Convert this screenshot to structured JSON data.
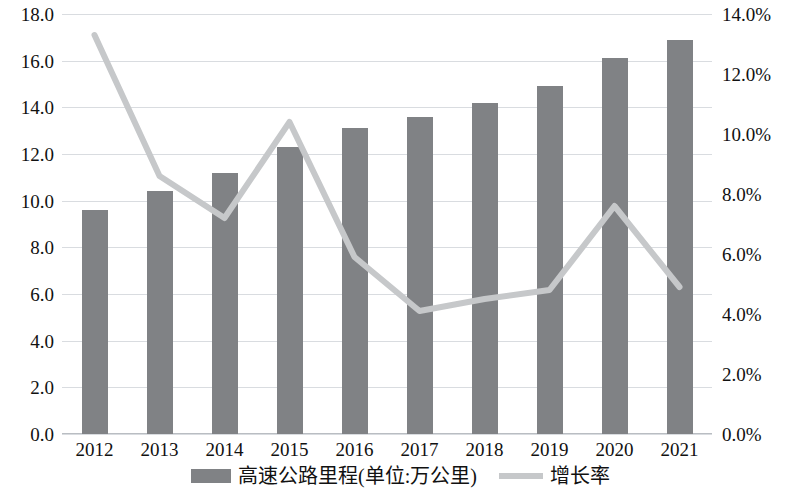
{
  "chart_data": {
    "type": "bar",
    "title": "",
    "subtitle": "",
    "xlabel": "",
    "ylabel": "",
    "grid": true,
    "legend_position": "bottom",
    "categories": [
      "2012",
      "2013",
      "2014",
      "2015",
      "2016",
      "2017",
      "2018",
      "2019",
      "2020",
      "2021"
    ],
    "axes": {
      "left": {
        "label": "高速公路里程(单位:万公里)",
        "min": 0.0,
        "max": 18.0,
        "step": 2.0,
        "ticks": [
          "0.0",
          "2.0",
          "4.0",
          "6.0",
          "8.0",
          "10.0",
          "12.0",
          "14.0",
          "16.0",
          "18.0"
        ],
        "tick_values": [
          0.0,
          2.0,
          4.0,
          6.0,
          8.0,
          10.0,
          12.0,
          14.0,
          16.0,
          18.0
        ]
      },
      "right": {
        "label": "增长率",
        "min": 0.0,
        "max": 14.0,
        "step": 2.0,
        "ticks": [
          "0.0%",
          "2.0%",
          "4.0%",
          "6.0%",
          "8.0%",
          "10.0%",
          "12.0%",
          "14.0%"
        ],
        "tick_values": [
          0.0,
          2.0,
          4.0,
          6.0,
          8.0,
          10.0,
          12.0,
          14.0
        ]
      }
    },
    "series": [
      {
        "name": "高速公路里程(单位:万公里)",
        "type": "bar",
        "axis": "left",
        "color": "#808285",
        "values": [
          9.6,
          10.4,
          11.2,
          12.3,
          13.1,
          13.6,
          14.2,
          14.9,
          16.1,
          16.9
        ]
      },
      {
        "name": "增长率",
        "type": "line",
        "axis": "right",
        "color": "#c6c8ca",
        "values": [
          13.3,
          8.6,
          7.2,
          10.4,
          5.9,
          4.1,
          4.5,
          4.8,
          7.6,
          4.9
        ]
      }
    ]
  },
  "legend": {
    "bar_label": "高速公路里程(单位:万公里)",
    "line_label": "增长率"
  }
}
